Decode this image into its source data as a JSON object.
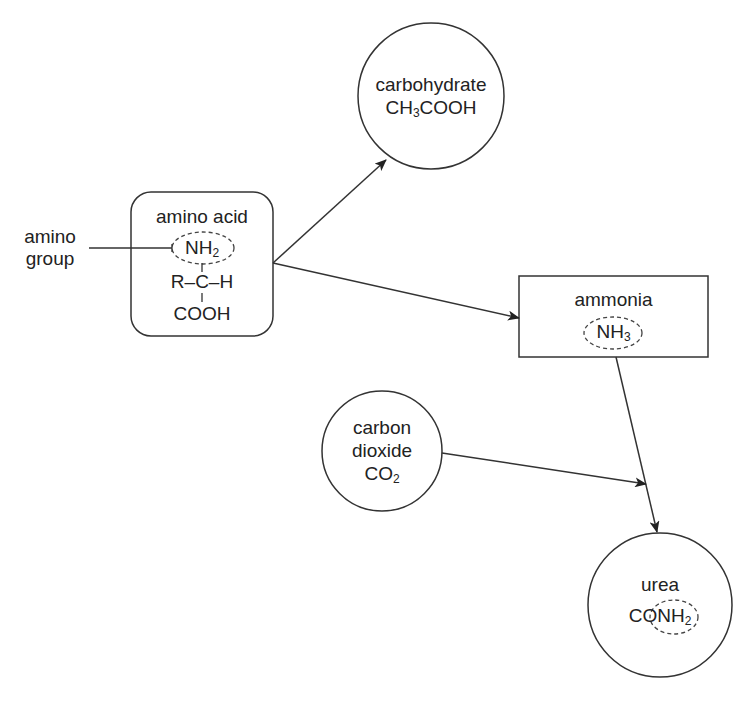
{
  "diagram": {
    "type": "flow",
    "nodes": {
      "amino_acid": {
        "title": "amino acid",
        "formula_line1": "NH",
        "formula_line1_sub": "2",
        "formula_line2": "R–C–H",
        "formula_line3": "COOH",
        "shape": "rounded-rectangle"
      },
      "carbohydrate": {
        "title": "carbohydrate",
        "formula_prefix": "CH",
        "formula_sub": "3",
        "formula_suffix": "COOH",
        "shape": "circle"
      },
      "ammonia": {
        "title": "ammonia",
        "formula": "NH",
        "formula_sub": "3",
        "shape": "rectangle"
      },
      "carbon_dioxide": {
        "title_line1": "carbon",
        "title_line2": "dioxide",
        "formula": "CO",
        "formula_sub": "2",
        "shape": "circle"
      },
      "urea": {
        "title": "urea",
        "formula_prefix": "CO",
        "formula_group": "NH",
        "formula_sub": "2",
        "shape": "circle"
      }
    },
    "annotations": {
      "amino_group_line1": "amino",
      "amino_group_line2": "group"
    },
    "edges": [
      {
        "from": "amino_acid",
        "to": "carbohydrate"
      },
      {
        "from": "amino_acid",
        "to": "ammonia"
      },
      {
        "from": "ammonia",
        "to": "urea"
      },
      {
        "from": "carbon_dioxide",
        "to": "urea"
      }
    ],
    "colors": {
      "stroke": "#333333",
      "text": "#222222",
      "background": "#ffffff"
    }
  }
}
